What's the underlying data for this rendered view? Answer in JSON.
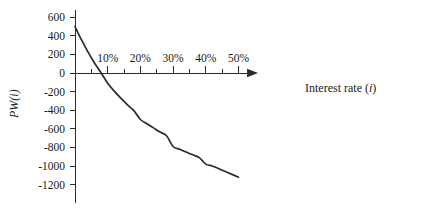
{
  "chart_data": {
    "type": "line",
    "title": "",
    "xlabel": "Interest rate (i)",
    "ylabel": "PW(i)",
    "xlim": [
      0,
      52
    ],
    "ylim": [
      -1300,
      650
    ],
    "grid": false,
    "legend": null,
    "x_tick_labels": [
      "10%",
      "20%",
      "30%",
      "40%",
      "50%"
    ],
    "x_tick_values": [
      10,
      20,
      30,
      40,
      50
    ],
    "x_minor_tick_values": [
      0,
      5,
      15,
      25,
      35,
      45
    ],
    "y_tick_labels": [
      "600",
      "400",
      "200",
      "0",
      "-200",
      "-400",
      "-600",
      "-800",
      "-1000",
      "-1200"
    ],
    "y_tick_values": [
      600,
      400,
      200,
      0,
      -200,
      -400,
      -600,
      -800,
      -1000,
      -1200
    ],
    "series": [
      {
        "name": "PW(i)",
        "color": "#2b2b2b",
        "x": [
          0,
          2,
          4,
          6,
          8,
          10,
          12,
          14,
          16,
          18,
          20,
          22,
          24,
          26,
          28,
          30,
          32,
          34,
          36,
          38,
          40,
          42,
          44,
          46,
          48,
          50
        ],
        "y": [
          500,
          355,
          225,
          105,
          0,
          -110,
          -195,
          -270,
          -340,
          -405,
          -500,
          -545,
          -590,
          -635,
          -675,
          -790,
          -820,
          -850,
          -880,
          -910,
          -980,
          -1000,
          -1030,
          -1060,
          -1090,
          -1120
        ]
      }
    ],
    "annotations": [
      {
        "label": "zero crossing (IRR)",
        "x": 8,
        "y": 0
      }
    ]
  },
  "axes": {
    "x_axis_label": "Interest rate (i)",
    "x_axis_label_main": "Interest rate (",
    "x_axis_label_var": "i",
    "x_axis_label_end": ")",
    "y_axis_label": "PW(i)",
    "y_axis_label_main": "PW",
    "y_axis_label_paren_open": "(",
    "y_axis_label_var": "i",
    "y_axis_label_paren_close": ")"
  },
  "ticks": {
    "y": [
      {
        "label": "600",
        "value": 600
      },
      {
        "label": "400",
        "value": 400
      },
      {
        "label": "200",
        "value": 200
      },
      {
        "label": "0",
        "value": 0
      },
      {
        "label": "-200",
        "value": -200
      },
      {
        "label": "-400",
        "value": -400
      },
      {
        "label": "-600",
        "value": -600
      },
      {
        "label": "-800",
        "value": -800
      },
      {
        "label": "-1000",
        "value": -1000
      },
      {
        "label": "-1200",
        "value": -1200
      }
    ],
    "x": [
      {
        "label": "10%",
        "value": 10
      },
      {
        "label": "20%",
        "value": 20
      },
      {
        "label": "30%",
        "value": 30
      },
      {
        "label": "40%",
        "value": 40
      },
      {
        "label": "50%",
        "value": 50
      }
    ]
  },
  "colors": {
    "curve": "#2b2b2b",
    "axis": "#2b2b2b",
    "text": "#1a1a1a",
    "background": "#ffffff"
  }
}
